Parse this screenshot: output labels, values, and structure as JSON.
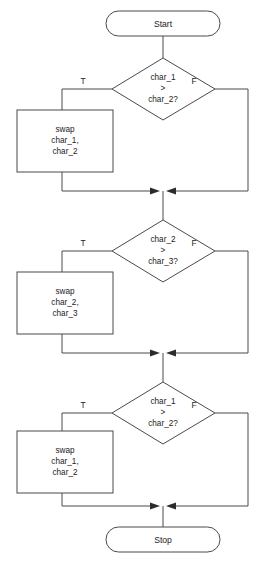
{
  "diagram": {
    "type": "flowchart",
    "background_color": "#ffffff",
    "line_color": "#4a4a4a",
    "text_color": "#1b1b1b",
    "terminals": {
      "start": "Start",
      "stop": "Stop"
    },
    "branch_labels": {
      "true": "T",
      "false": "F"
    },
    "sections": [
      {
        "id": "section-1",
        "decision": {
          "line1": "char_1",
          "line2": ">",
          "line3": "char_2?"
        },
        "process": {
          "line1": "swap",
          "line2": "char_1,",
          "line3": "char_2"
        }
      },
      {
        "id": "section-2",
        "decision": {
          "line1": "char_2",
          "line2": ">",
          "line3": "char_3?"
        },
        "process": {
          "line1": "swap",
          "line2": "char_2,",
          "line3": "char_3"
        }
      },
      {
        "id": "section-3",
        "decision": {
          "line1": "char_1",
          "line2": ">",
          "line3": "char_2?"
        },
        "process": {
          "line1": "swap",
          "line2": "char_1,",
          "line3": "char_2"
        }
      }
    ]
  }
}
